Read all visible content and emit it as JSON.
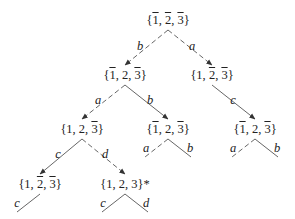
{
  "diagram": {
    "type": "tree",
    "nodes": [
      {
        "id": "root",
        "label": "{1̄, 2̄, 3̄}",
        "parts": [
          {
            "t": "{"
          },
          {
            "t": "1",
            "bar": true
          },
          {
            "t": ", "
          },
          {
            "t": "2",
            "bar": true
          },
          {
            "t": ", "
          },
          {
            "t": "3",
            "bar": true
          },
          {
            "t": "}"
          }
        ],
        "x": 168,
        "y": 13
      },
      {
        "id": "n_l2_left",
        "label": "{1̄, 2, 3̄}",
        "parts": [
          {
            "t": "{"
          },
          {
            "t": "1",
            "bar": true
          },
          {
            "t": ", 2, "
          },
          {
            "t": "3",
            "bar": true
          },
          {
            "t": "}"
          }
        ],
        "x": 125,
        "y": 68
      },
      {
        "id": "n_l2_right",
        "label": "{1, 2̄, 3̄}",
        "parts": [
          {
            "t": "{1, "
          },
          {
            "t": "2",
            "bar": true
          },
          {
            "t": ", "
          },
          {
            "t": "3",
            "bar": true
          },
          {
            "t": "}"
          }
        ],
        "x": 212,
        "y": 68
      },
      {
        "id": "n_l3_left",
        "label": "{1, 2, 3̄}",
        "parts": [
          {
            "t": "{1, 2, "
          },
          {
            "t": "3",
            "bar": true
          },
          {
            "t": "}"
          }
        ],
        "x": 82,
        "y": 122
      },
      {
        "id": "n_l3_mid",
        "label": "{1̄, 2, 3̄}",
        "parts": [
          {
            "t": "{"
          },
          {
            "t": "1",
            "bar": true
          },
          {
            "t": ", 2, "
          },
          {
            "t": "3",
            "bar": true
          },
          {
            "t": "}"
          }
        ],
        "x": 168,
        "y": 122
      },
      {
        "id": "n_l3_right",
        "label": "{1̄, 2, 3̄}",
        "parts": [
          {
            "t": "{"
          },
          {
            "t": "1",
            "bar": true
          },
          {
            "t": ", 2, "
          },
          {
            "t": "3",
            "bar": true
          },
          {
            "t": "}"
          }
        ],
        "x": 255,
        "y": 122
      },
      {
        "id": "n_l4_left",
        "label": "{1, 2̄, 3̄}",
        "parts": [
          {
            "t": "{1, "
          },
          {
            "t": "2",
            "bar": true
          },
          {
            "t": ", "
          },
          {
            "t": "3",
            "bar": true
          },
          {
            "t": "}"
          }
        ],
        "x": 40,
        "y": 177
      },
      {
        "id": "n_l4_mid",
        "label": "{1, 2, 3}*",
        "parts": [
          {
            "t": "{1, 2, 3}*"
          }
        ],
        "x": 125,
        "y": 177
      }
    ],
    "edges": [
      {
        "from": "root",
        "to": "n_l2_left",
        "label": "b",
        "style": "dashed",
        "arrow": true,
        "x1": 168,
        "y1": 30,
        "x2": 125,
        "y2": 65,
        "lx": 140,
        "ly": 40
      },
      {
        "from": "root",
        "to": "n_l2_right",
        "label": "a",
        "style": "dashed",
        "arrow": true,
        "x1": 168,
        "y1": 30,
        "x2": 212,
        "y2": 65,
        "lx": 192,
        "ly": 40
      },
      {
        "from": "n_l2_left",
        "to": "n_l3_left",
        "label": "a",
        "style": "dashed",
        "arrow": true,
        "x1": 125,
        "y1": 85,
        "x2": 82,
        "y2": 119,
        "lx": 98,
        "ly": 94
      },
      {
        "from": "n_l2_left",
        "to": "n_l3_mid",
        "label": "b",
        "style": "solid",
        "arrow": true,
        "x1": 125,
        "y1": 85,
        "x2": 168,
        "y2": 119,
        "lx": 150,
        "ly": 94
      },
      {
        "from": "n_l2_right",
        "to": "n_l3_right",
        "label": "c",
        "style": "solid",
        "arrow": true,
        "x1": 212,
        "y1": 85,
        "x2": 255,
        "y2": 119,
        "lx": 233,
        "ly": 94
      },
      {
        "from": "n_l3_left",
        "to": "n_l4_left",
        "label": "c",
        "style": "solid",
        "arrow": true,
        "x1": 82,
        "y1": 139,
        "x2": 40,
        "y2": 174,
        "lx": 58,
        "ly": 148
      },
      {
        "from": "n_l3_left",
        "to": "n_l4_mid",
        "label": "d",
        "style": "dashed",
        "arrow": true,
        "x1": 82,
        "y1": 139,
        "x2": 125,
        "y2": 174,
        "lx": 105,
        "ly": 148
      },
      {
        "from": "n_l3_mid",
        "to": null,
        "label": "a",
        "style": "dashed",
        "arrow": false,
        "x1": 168,
        "y1": 139,
        "x2": 145,
        "y2": 157,
        "lx": 146,
        "ly": 142
      },
      {
        "from": "n_l3_mid",
        "to": null,
        "label": "b",
        "style": "solid",
        "arrow": false,
        "x1": 168,
        "y1": 139,
        "x2": 191,
        "y2": 157,
        "lx": 190,
        "ly": 142
      },
      {
        "from": "n_l3_right",
        "to": null,
        "label": "a",
        "style": "dashed",
        "arrow": false,
        "x1": 255,
        "y1": 139,
        "x2": 232,
        "y2": 157,
        "lx": 233,
        "ly": 142
      },
      {
        "from": "n_l3_right",
        "to": null,
        "label": "b",
        "style": "solid",
        "arrow": false,
        "x1": 255,
        "y1": 139,
        "x2": 278,
        "y2": 157,
        "lx": 277,
        "ly": 142
      },
      {
        "from": "n_l4_left",
        "to": null,
        "label": "c",
        "style": "solid",
        "arrow": false,
        "x1": 40,
        "y1": 194,
        "x2": 17,
        "y2": 212,
        "lx": 17,
        "ly": 197
      },
      {
        "from": "n_l4_mid",
        "to": null,
        "label": "c",
        "style": "solid",
        "arrow": false,
        "x1": 125,
        "y1": 194,
        "x2": 102,
        "y2": 212,
        "lx": 103,
        "ly": 197
      },
      {
        "from": "n_l4_mid",
        "to": null,
        "label": "d",
        "style": "solid",
        "arrow": false,
        "x1": 125,
        "y1": 194,
        "x2": 148,
        "y2": 212,
        "lx": 146,
        "ly": 197
      }
    ],
    "colors": {
      "line": "#555555",
      "text": "#222222",
      "background": "#ffffff"
    }
  }
}
